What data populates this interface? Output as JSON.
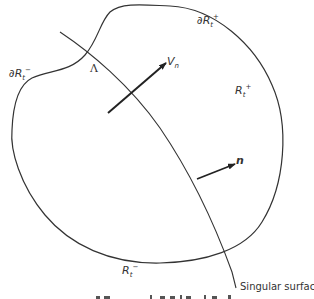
{
  "figure": {
    "type": "diagram",
    "colors": {
      "stroke": "#333333",
      "background": "#ffffff"
    },
    "labels": {
      "boundary_minus": {
        "base": "∂R",
        "sub": "t",
        "sup": "−"
      },
      "boundary_plus": {
        "base": "∂R",
        "sub": "t",
        "sup": "+"
      },
      "region_plus": {
        "base": "R",
        "sub": "t",
        "sup": "+"
      },
      "region_minus": {
        "base": "R",
        "sub": "t",
        "sup": "−"
      },
      "intersection": "Λ",
      "velocity": {
        "base": "V",
        "sub": "n"
      },
      "normal": "n",
      "singular_surface": "Singular surface"
    },
    "elements": [
      {
        "name": "region-boundary",
        "kind": "closed curve"
      },
      {
        "name": "singular-surface",
        "kind": "curve crossing region"
      },
      {
        "name": "velocity-arrow",
        "kind": "arrow",
        "label": "V_n"
      },
      {
        "name": "normal-arrow",
        "kind": "arrow",
        "label": "n"
      }
    ]
  }
}
